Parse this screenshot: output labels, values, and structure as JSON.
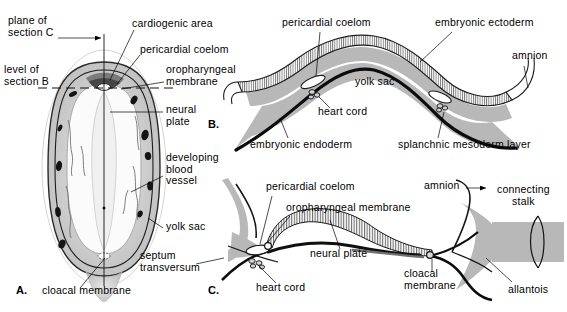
{
  "figure": {
    "background_color": "#ffffff",
    "ink_color": "#000000",
    "fill_gray": "#b8b8b8",
    "fill_light_gray": "#d8d8d8",
    "fill_dark": "#1a1a1a"
  },
  "panels": [
    {
      "id": "A",
      "id_label": "A.",
      "caption": "Dorsal view of the embryonic disc with yolk sac",
      "labels": [
        {
          "key": "plane_of_section_c",
          "text": "plane of\nsection C",
          "x": 8,
          "y": 20
        },
        {
          "key": "level_of_section_b",
          "text": "level of\nsection B",
          "x": 4,
          "y": 70
        },
        {
          "key": "cardiogenic_area",
          "text": "cardiogenic area",
          "x": 132,
          "y": 22
        },
        {
          "key": "pericardial_coelom",
          "text": "pericardial coelom",
          "x": 140,
          "y": 48
        },
        {
          "key": "oropharyngeal_membrane",
          "text": "oropharyngeal\nmembrane",
          "x": 166,
          "y": 68
        },
        {
          "key": "neural_plate",
          "text": "neural\nplate",
          "x": 166,
          "y": 108
        },
        {
          "key": "developing_blood_vessel",
          "text": "developing\nblood\nvessel",
          "x": 166,
          "y": 158
        },
        {
          "key": "yolk_sac",
          "text": "yolk sac",
          "x": 166,
          "y": 224
        },
        {
          "key": "septum_transversum",
          "text": "septum\ntransversum",
          "x": 142,
          "y": 254
        },
        {
          "key": "cloacal_membrane",
          "text": "cloacal membrane",
          "x": 42,
          "y": 290
        }
      ]
    },
    {
      "id": "B",
      "id_label": "B.",
      "caption": "Transverse section through the cardiogenic region",
      "labels": [
        {
          "key": "pericardial_coelom",
          "text": "pericardial coelom",
          "x": 282,
          "y": 20
        },
        {
          "key": "embryonic_ectoderm",
          "text": "embryonic ectoderm",
          "x": 435,
          "y": 20
        },
        {
          "key": "amnion",
          "text": "amnion",
          "x": 512,
          "y": 55
        },
        {
          "key": "yolk_sac",
          "text": "yolk sac",
          "x": 355,
          "y": 80
        },
        {
          "key": "heart_cord",
          "text": "heart cord",
          "x": 316,
          "y": 110
        },
        {
          "key": "embryonic_endoderm",
          "text": "embryonic endoderm",
          "x": 250,
          "y": 142
        },
        {
          "key": "splanchnic_mesoderm_layer",
          "text": "splanchnic mesoderm layer",
          "x": 400,
          "y": 142
        }
      ]
    },
    {
      "id": "C",
      "id_label": "C.",
      "caption": "Sagittal section showing head and tail folding",
      "labels": [
        {
          "key": "pericardial_coelom",
          "text": "pericardial coelom",
          "x": 266,
          "y": 185
        },
        {
          "key": "oropharyngeal_membrane",
          "text": "oropharyngeal membrane",
          "x": 286,
          "y": 206
        },
        {
          "key": "amnion",
          "text": "amnion",
          "x": 427,
          "y": 183
        },
        {
          "key": "connecting_stalk",
          "text": "connecting\nstalk",
          "x": 497,
          "y": 188
        },
        {
          "key": "neural_plate",
          "text": "neural plate",
          "x": 312,
          "y": 252
        },
        {
          "key": "heart_cord",
          "text": "heart cord",
          "x": 256,
          "y": 286
        },
        {
          "key": "cloacal_membrane",
          "text": "cloacal\nmembrane",
          "x": 406,
          "y": 272
        },
        {
          "key": "allantois",
          "text": "allantois",
          "x": 508,
          "y": 287
        }
      ]
    }
  ]
}
